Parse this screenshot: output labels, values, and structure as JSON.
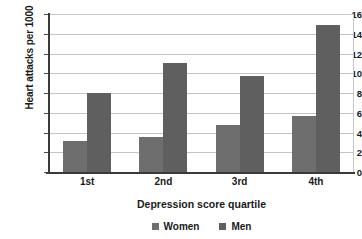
{
  "chart_data": {
    "type": "bar",
    "title": "",
    "subtitle": "",
    "xlabel": "Depression score quartile",
    "ylabel": "Heart attacks per 1000",
    "categories": [
      "1st",
      "2nd",
      "3rd",
      "4th"
    ],
    "series": [
      {
        "name": "Women",
        "color": "#6e6e6e",
        "values": [
          3.1,
          3.5,
          4.8,
          5.7
        ]
      },
      {
        "name": "Men",
        "color": "#5f5f5f",
        "values": [
          8.0,
          11.0,
          9.7,
          14.9
        ]
      }
    ],
    "ylim": [
      0,
      16
    ],
    "ytick_step": 2,
    "yticks": [
      0,
      2,
      4,
      6,
      8,
      10,
      12,
      14,
      16
    ],
    "ytick_labels": [
      "0",
      "2",
      "4",
      "6",
      "8",
      "10",
      "12",
      "14",
      "16"
    ],
    "grid": true,
    "grid_axis": "y",
    "legend_position": "bottom",
    "legend_entries": [
      "Women",
      "Men"
    ],
    "annotations": []
  },
  "colors": {
    "background": "#ffffff",
    "axis": "#3a3a3a",
    "gridline": "#c4c4c4",
    "text": "#1a1a1a",
    "women": "#6e6e6e",
    "men": "#5f5f5f"
  }
}
